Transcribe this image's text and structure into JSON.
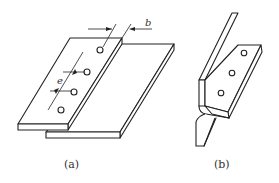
{
  "figure": {
    "panels": [
      {
        "id": "a",
        "caption": "(a)",
        "description": "Lap joint of two flat plates with a row of rivet/spot holes",
        "dimensions": [
          {
            "symbol": "b",
            "meaning": "edge distance / overlap width"
          },
          {
            "symbol": "e",
            "meaning": "pitch between holes"
          }
        ],
        "hole_count": 4
      },
      {
        "id": "b",
        "caption": "(b)",
        "description": "Joggled / bent flange joint with a row of holes",
        "hole_count": 3
      }
    ]
  }
}
